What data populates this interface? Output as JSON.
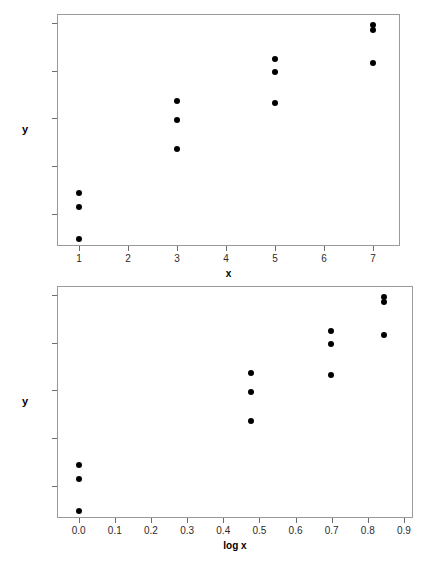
{
  "header": {
    "left_text": "",
    "right_text": ""
  },
  "chart_data": [
    {
      "id": "top",
      "type": "scatter",
      "title": "",
      "xlabel": "x",
      "ylabel": "y",
      "xlim": [
        0.55,
        7.55
      ],
      "ylim": [
        13.35,
        25.45
      ],
      "xticks": [
        "1",
        "2",
        "3",
        "4",
        "5",
        "6",
        "7"
      ],
      "xtick_values": [
        1,
        2,
        3,
        4,
        5,
        6,
        7
      ],
      "yticks": [
        "25.0",
        "22.5",
        "20.0",
        "17.5",
        "15.0"
      ],
      "ytick_values": [
        25.0,
        22.5,
        20.0,
        17.5,
        15.0
      ],
      "grid": false,
      "legend": "none",
      "points": [
        {
          "x": 1,
          "y": 16.1
        },
        {
          "x": 1,
          "y": 15.4
        },
        {
          "x": 1,
          "y": 13.7
        },
        {
          "x": 3,
          "y": 20.9
        },
        {
          "x": 3,
          "y": 19.9
        },
        {
          "x": 3,
          "y": 18.4
        },
        {
          "x": 5,
          "y": 23.1
        },
        {
          "x": 5,
          "y": 22.4
        },
        {
          "x": 5,
          "y": 20.8
        },
        {
          "x": 7,
          "y": 24.9
        },
        {
          "x": 7,
          "y": 24.6
        },
        {
          "x": 7,
          "y": 22.9
        }
      ]
    },
    {
      "id": "bottom",
      "type": "scatter",
      "title": "",
      "xlabel": "log x",
      "ylabel": "y",
      "xlim": [
        -0.06,
        0.925
      ],
      "ylim": [
        13.35,
        25.45
      ],
      "xticks": [
        "0.0",
        "0.1",
        "0.2",
        "0.3",
        "0.4",
        "0.5",
        "0.6",
        "0.7",
        "0.8",
        "0.9"
      ],
      "xtick_values": [
        0.0,
        0.1,
        0.2,
        0.3,
        0.4,
        0.5,
        0.6,
        0.7,
        0.8,
        0.9
      ],
      "yticks": [
        "25.0",
        "22.5",
        "20.0",
        "17.5",
        "15.0"
      ],
      "ytick_values": [
        25.0,
        22.5,
        20.0,
        17.5,
        15.0
      ],
      "grid": false,
      "legend": "none",
      "points": [
        {
          "x": 0.0,
          "y": 16.1
        },
        {
          "x": 0.0,
          "y": 15.4
        },
        {
          "x": 0.0,
          "y": 13.7
        },
        {
          "x": 0.477,
          "y": 20.9
        },
        {
          "x": 0.477,
          "y": 19.9
        },
        {
          "x": 0.477,
          "y": 18.4
        },
        {
          "x": 0.699,
          "y": 23.1
        },
        {
          "x": 0.699,
          "y": 22.4
        },
        {
          "x": 0.699,
          "y": 20.8
        },
        {
          "x": 0.845,
          "y": 24.9
        },
        {
          "x": 0.845,
          "y": 24.6
        },
        {
          "x": 0.845,
          "y": 22.9
        }
      ]
    }
  ]
}
